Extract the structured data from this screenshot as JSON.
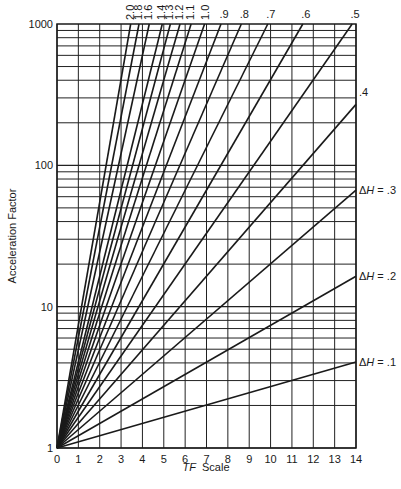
{
  "chart_data": {
    "type": "line",
    "title": "",
    "xlabel": "TF Scale",
    "xlabel_italic_part": "TF",
    "xlabel_rest": "Scale",
    "ylabel": "Acceleration Factor",
    "xlim": [
      0,
      14
    ],
    "ylim": [
      1,
      1000
    ],
    "yscale": "log",
    "x_ticks": [
      0,
      1,
      2,
      3,
      4,
      5,
      6,
      7,
      8,
      9,
      10,
      11,
      12,
      13,
      14
    ],
    "y_ticks": [
      1,
      10,
      100,
      1000
    ],
    "y_tick_labels": [
      "1",
      "10",
      "100",
      "1000"
    ],
    "grid": true,
    "formula": "AF = exp(deltaH * TF)",
    "series": [
      {
        "name": "ΔH = .1",
        "deltaH": 0.1,
        "label": "ΔH = .1",
        "label_pos": "right",
        "points": [
          [
            0,
            1
          ],
          [
            14,
            4.06
          ]
        ]
      },
      {
        "name": "ΔH = .2",
        "deltaH": 0.2,
        "label": "ΔH = .2",
        "label_pos": "right",
        "points": [
          [
            0,
            1
          ],
          [
            14,
            16.4
          ]
        ]
      },
      {
        "name": "ΔH = .3",
        "deltaH": 0.3,
        "label": "ΔH = .3",
        "label_pos": "right",
        "points": [
          [
            0,
            1
          ],
          [
            14,
            66.7
          ]
        ]
      },
      {
        "name": ".4",
        "deltaH": 0.4,
        "label": ".4",
        "label_pos": "right",
        "points": [
          [
            0,
            1
          ],
          [
            14,
            270
          ]
        ]
      },
      {
        "name": ".5",
        "deltaH": 0.5,
        "label": ".5",
        "label_pos": "top",
        "points": [
          [
            0,
            1
          ],
          [
            13.82,
            1000
          ]
        ]
      },
      {
        "name": ".6",
        "deltaH": 0.6,
        "label": ".6",
        "label_pos": "top",
        "points": [
          [
            0,
            1
          ],
          [
            11.51,
            1000
          ]
        ]
      },
      {
        "name": ".7",
        "deltaH": 0.7,
        "label": ".7",
        "label_pos": "top",
        "points": [
          [
            0,
            1
          ],
          [
            9.87,
            1000
          ]
        ]
      },
      {
        "name": ".8",
        "deltaH": 0.8,
        "label": ".8",
        "label_pos": "top",
        "points": [
          [
            0,
            1
          ],
          [
            8.63,
            1000
          ]
        ]
      },
      {
        "name": ".9",
        "deltaH": 0.9,
        "label": ".9",
        "label_pos": "top",
        "points": [
          [
            0,
            1
          ],
          [
            7.68,
            1000
          ]
        ]
      },
      {
        "name": "1.0",
        "deltaH": 1.0,
        "label": "1.0",
        "label_pos": "top",
        "points": [
          [
            0,
            1
          ],
          [
            6.91,
            1000
          ]
        ]
      },
      {
        "name": "1.1",
        "deltaH": 1.1,
        "label": "1.1",
        "label_pos": "top",
        "points": [
          [
            0,
            1
          ],
          [
            6.28,
            1000
          ]
        ]
      },
      {
        "name": "1.2",
        "deltaH": 1.2,
        "label": "1.2",
        "label_pos": "top",
        "points": [
          [
            0,
            1
          ],
          [
            5.76,
            1000
          ]
        ]
      },
      {
        "name": "1.3",
        "deltaH": 1.3,
        "label": "1.3",
        "label_pos": "top",
        "points": [
          [
            0,
            1
          ],
          [
            5.31,
            1000
          ]
        ]
      },
      {
        "name": "1.4",
        "deltaH": 1.4,
        "label": "1.4",
        "label_pos": "top",
        "points": [
          [
            0,
            1
          ],
          [
            4.93,
            1000
          ]
        ]
      },
      {
        "name": "1.6",
        "deltaH": 1.6,
        "label": "1.6",
        "label_pos": "top",
        "points": [
          [
            0,
            1
          ],
          [
            4.32,
            1000
          ]
        ]
      },
      {
        "name": "1.8",
        "deltaH": 1.8,
        "label": "1.8",
        "label_pos": "top",
        "points": [
          [
            0,
            1
          ],
          [
            3.84,
            1000
          ]
        ]
      },
      {
        "name": "2.0",
        "deltaH": 2.0,
        "label": "2.0",
        "label_pos": "top",
        "points": [
          [
            0,
            1
          ],
          [
            3.45,
            1000
          ]
        ]
      }
    ]
  },
  "layout": {
    "plot_left": 57,
    "plot_right": 356,
    "plot_top": 24,
    "plot_bottom": 448,
    "line_color": "#1a1a1a",
    "grid_color": "#222222"
  }
}
